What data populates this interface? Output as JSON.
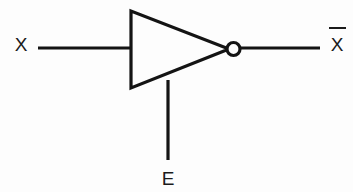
{
  "diagram": {
    "type": "logic-gate-schematic",
    "background_color": "#fdfdfd",
    "line_color": "#141414",
    "text_color": "#1b1b1b",
    "stroke_width": 3.2,
    "gate": {
      "name": "inverter",
      "symbol": "triangle-with-bubble",
      "triangle": {
        "top_left_x": 131,
        "top_left_y": 11,
        "bottom_left_x": 131,
        "bottom_left_y": 88,
        "apex_x": 227,
        "apex_y": 49
      },
      "bubble": {
        "center_x": 233.5,
        "center_y": 49,
        "radius": 6.5
      }
    },
    "wires": [
      {
        "name": "input-wire-x",
        "x1": 38,
        "y1": 48,
        "x2": 131,
        "y2": 48
      },
      {
        "name": "output-wire-xbar",
        "x1": 240,
        "y1": 48,
        "x2": 320,
        "y2": 48
      },
      {
        "name": "enable-wire-e",
        "x1": 168,
        "y1": 80,
        "x2": 168,
        "y2": 160
      }
    ],
    "labels": {
      "input": {
        "text": "X",
        "x": 21,
        "y": 51,
        "overbar": false
      },
      "output": {
        "text": "X",
        "x": 337,
        "y": 51,
        "overbar": true,
        "overbar_x1": 329,
        "overbar_x2": 346,
        "overbar_y": 28
      },
      "enable": {
        "text": "E",
        "x": 168,
        "y": 185,
        "overbar": false
      }
    }
  }
}
